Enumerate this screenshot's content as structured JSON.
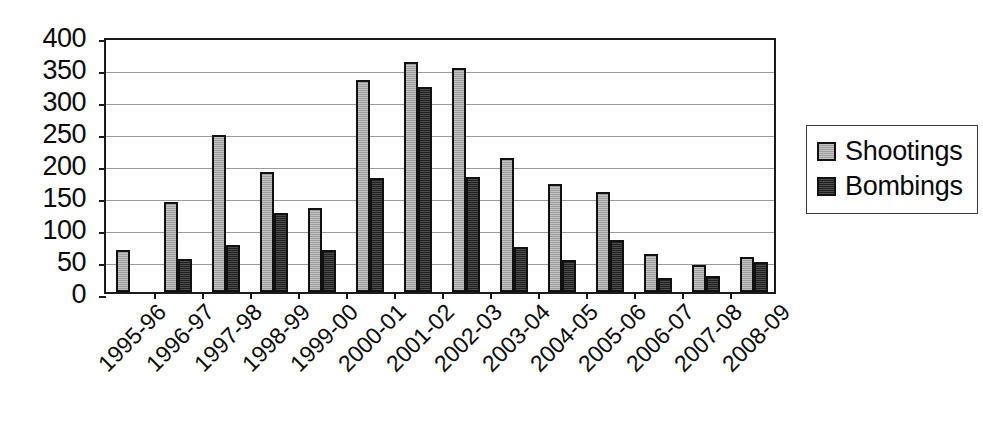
{
  "chart_data": {
    "type": "bar",
    "title": "",
    "subtitle": "",
    "xlabel": "",
    "ylabel": "",
    "ylim": [
      0,
      400
    ],
    "ytick_step": 50,
    "yticks": [
      400,
      350,
      300,
      250,
      200,
      150,
      100,
      50,
      0
    ],
    "grid": true,
    "grid_axis": "y",
    "legend_position": "right",
    "categories": [
      "1995-96",
      "1996-97",
      "1997-98",
      "1998-99",
      "1999-00",
      "2000-01",
      "2001-02",
      "2002-03",
      "2003-04",
      "2004-05",
      "2005-06",
      "2006-07",
      "2007-08",
      "2008-09"
    ],
    "series": [
      {
        "name": "Shootings",
        "color": "#a8a8a8",
        "values": [
          65,
          141,
          245,
          188,
          131,
          332,
          360,
          350,
          210,
          168,
          157,
          60,
          42,
          55
        ]
      },
      {
        "name": "Bombings",
        "color": "#2b2b2b",
        "values": [
          0,
          51,
          73,
          123,
          66,
          178,
          320,
          180,
          71,
          50,
          82,
          22,
          25,
          47
        ]
      }
    ]
  },
  "legend": {
    "items": [
      {
        "label": "Shootings",
        "swatch": "shootings"
      },
      {
        "label": "Bombings",
        "swatch": "bombings"
      }
    ]
  },
  "colors": {
    "shootings": "#a8a8a8",
    "bombings": "#2b2b2b",
    "axis": "#1a1a1a",
    "grid": "#9a9a9a",
    "background": "#ffffff"
  }
}
